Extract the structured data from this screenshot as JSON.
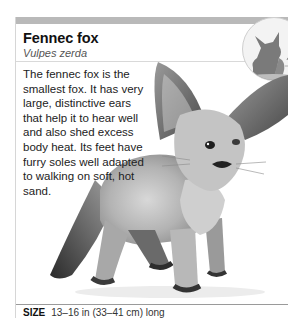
{
  "header": {
    "title": "Fennec fox",
    "scientific_name": "Vulpes zerda"
  },
  "badge": {
    "icon": "fox-silhouette-icon"
  },
  "description": "The fennec fox is the smallest fox. It has very large, distinctive ears that help it to hear well and also shed excess body heat. Its feet have furry soles well adapted to walking on soft, hot sand.",
  "photo": {
    "icon": "fennec-fox-photo"
  },
  "size": {
    "label": "SIZE",
    "value": "13–16 in (33–41 cm) long"
  },
  "colors": {
    "top_bar": "#b9b9b9",
    "rule": "#d6d6d6",
    "text": "#1a1a1a"
  }
}
